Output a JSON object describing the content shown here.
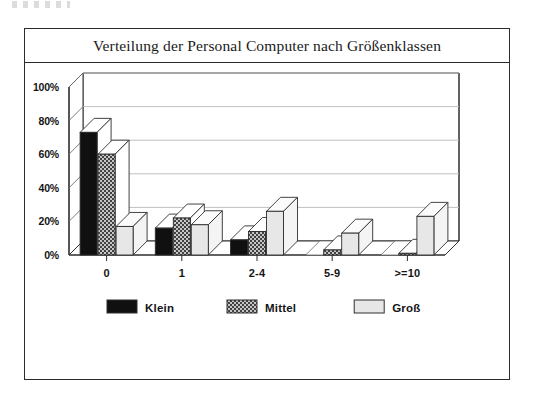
{
  "chart_data": {
    "type": "bar",
    "title": "Verteilung der Personal Computer nach Größenklassen",
    "xlabel": "",
    "ylabel": "",
    "categories": [
      "0",
      "1",
      "2-4",
      "5-9",
      ">=10"
    ],
    "series": [
      {
        "name": "Klein",
        "values": [
          73,
          16,
          9,
          0,
          0
        ],
        "fill": "solid-black",
        "color": "#101010"
      },
      {
        "name": "Mittel",
        "values": [
          60,
          22,
          14,
          3,
          1
        ],
        "fill": "hatched",
        "color": "#9a9a9a"
      },
      {
        "name": "Groß",
        "values": [
          17,
          18,
          26,
          13,
          23
        ],
        "fill": "light-gray",
        "color": "#e2e2e2"
      }
    ],
    "ylim": [
      0,
      100
    ],
    "yticks": [
      "0%",
      "20%",
      "40%",
      "60%",
      "80%",
      "100%"
    ],
    "ytick_values": [
      0,
      20,
      40,
      60,
      80,
      100
    ],
    "grid": true,
    "legend_position": "bottom",
    "style": "3d-bars",
    "unit": "%"
  },
  "legend": {
    "items": [
      {
        "label": "Klein",
        "swatch": "solid-black-swatch"
      },
      {
        "label": "Mittel",
        "swatch": "hatched-swatch"
      },
      {
        "label": "Groß",
        "swatch": "light-gray-swatch"
      }
    ]
  }
}
